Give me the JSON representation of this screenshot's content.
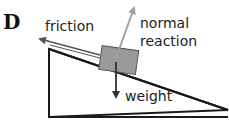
{
  "figure": {
    "option_letter": "D",
    "labels": {
      "friction": "friction",
      "normal_line1": "normal",
      "normal_line2": "reaction",
      "weight": "weight"
    },
    "colors": {
      "incline": "#1a1a1a",
      "block_fill": "#9a9a9a",
      "block_stroke": "#555555",
      "friction_arrow": "#555555",
      "normal_arrow": "#a0a0a0",
      "weight_arrow": "#333333"
    }
  }
}
